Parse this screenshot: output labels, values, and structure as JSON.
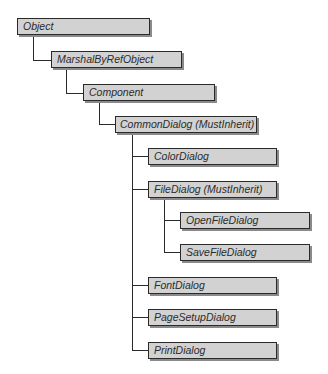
{
  "diagram": {
    "colors": {
      "box_fill": "#d2d2d2",
      "box_border": "#2a2a2a",
      "box_shadow": "#8a8a8a",
      "connector": "#2a2a2a",
      "text": "#2b2b2b",
      "background": "#ffffff"
    },
    "nodes": [
      {
        "id": "object",
        "label": "Object",
        "parent": null
      },
      {
        "id": "marshal-by-ref-object",
        "label": "MarshalByRefObject",
        "parent": "object"
      },
      {
        "id": "component",
        "label": "Component",
        "parent": "marshal-by-ref-object"
      },
      {
        "id": "common-dialog",
        "label": "CommonDialog (MustInherit)",
        "parent": "component"
      },
      {
        "id": "color-dialog",
        "label": "ColorDialog",
        "parent": "common-dialog"
      },
      {
        "id": "file-dialog",
        "label": "FileDialog (MustInherit)",
        "parent": "common-dialog"
      },
      {
        "id": "open-file-dialog",
        "label": "OpenFileDialog",
        "parent": "file-dialog"
      },
      {
        "id": "save-file-dialog",
        "label": "SaveFileDialog",
        "parent": "file-dialog"
      },
      {
        "id": "font-dialog",
        "label": "FontDialog",
        "parent": "common-dialog"
      },
      {
        "id": "page-setup-dialog",
        "label": "PageSetupDialog",
        "parent": "common-dialog"
      },
      {
        "id": "print-dialog",
        "label": "PrintDialog",
        "parent": "common-dialog"
      }
    ]
  }
}
